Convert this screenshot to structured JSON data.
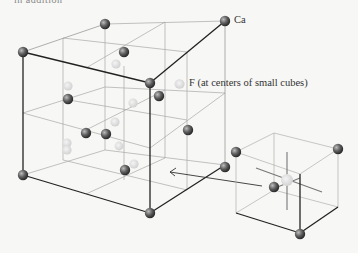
{
  "header_fragment": "in addition",
  "labels": {
    "ca": "Ca",
    "f": "F (at centers of small cubes)"
  },
  "colors": {
    "background": "#f7f7f5",
    "ca_atom": "#555555",
    "f_atom": "#d8d8d8",
    "edge_front": "#222222",
    "edge_inner": "#9a9a9a"
  },
  "structure": {
    "name": "fluorite unit cell",
    "cation": "Ca",
    "anion": "F",
    "inset": "small cube with F at center"
  }
}
